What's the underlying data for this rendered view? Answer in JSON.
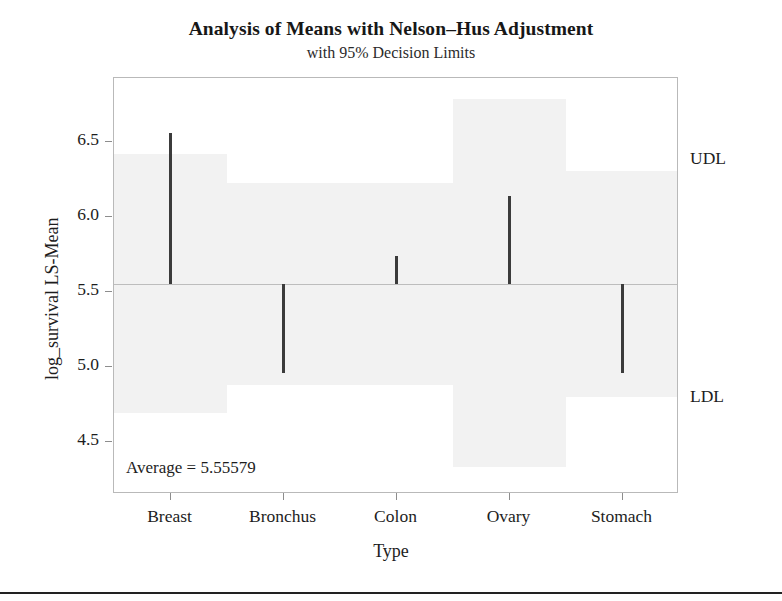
{
  "chart_data": {
    "type": "bar",
    "title": "Analysis of Means with Nelson–Hus Adjustment",
    "subtitle": "with 95% Decision Limits",
    "xlabel": "Type",
    "ylabel": "log_survival LS-Mean",
    "categories": [
      "Breast",
      "Bronchus",
      "Colon",
      "Ovary",
      "Stomach"
    ],
    "values": [
      6.56,
      4.96,
      5.74,
      6.14,
      4.96
    ],
    "center_value": 5.55579,
    "center_label": "Average = 5.55579",
    "upper_limits": [
      6.42,
      6.23,
      6.23,
      6.79,
      6.31
    ],
    "lower_limits": [
      4.69,
      4.88,
      4.88,
      4.33,
      4.8
    ],
    "limit_labels": {
      "upper": "UDL",
      "lower": "LDL"
    },
    "yticks": [
      "4.5",
      "5.0",
      "5.5",
      "6.0",
      "6.5"
    ],
    "ytick_values": [
      4.5,
      5.0,
      5.5,
      6.0,
      6.5
    ],
    "ylim": [
      4.15,
      6.93
    ],
    "grid": false,
    "legend": "none",
    "colors": {
      "bar": "#3b3b3b",
      "band": "#f2f2f2",
      "frame": "#b9b9b9",
      "center_line": "#bdbdbd",
      "text": "#1d1d1d"
    }
  }
}
